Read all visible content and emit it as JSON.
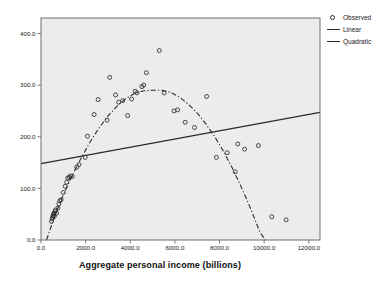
{
  "chart_data": {
    "type": "scatter",
    "title": "",
    "xlabel": "Aggregate personal income (billions)",
    "ylabel": "",
    "xlim": [
      0,
      12500
    ],
    "ylim": [
      0,
      430
    ],
    "xticks": [
      "0.0",
      "2000.0",
      "4000.0",
      "6000.0",
      "8000.0",
      "10000.0",
      "12000.0"
    ],
    "xtickvalues": [
      0,
      2000,
      4000,
      6000,
      8000,
      10000,
      12000
    ],
    "yticks": [
      "0.0",
      "100.0",
      "200.0",
      "300.0",
      "400.0"
    ],
    "ytickvalues": [
      0,
      100,
      200,
      300,
      400
    ],
    "grid": false,
    "legend_position": "right-outside",
    "plot_background": "#ececec",
    "frame_color": "#6e6e6e",
    "marker_color": "#2b2b2b",
    "line_color": "#2b2b2b",
    "series": [
      {
        "name": "Observed",
        "type": "scatter",
        "marker": "open-circle",
        "points": [
          [
            470,
            36
          ],
          [
            500,
            41
          ],
          [
            520,
            44
          ],
          [
            545,
            47
          ],
          [
            560,
            50
          ],
          [
            585,
            52
          ],
          [
            600,
            46
          ],
          [
            625,
            55
          ],
          [
            650,
            58
          ],
          [
            700,
            52
          ],
          [
            760,
            62
          ],
          [
            800,
            70
          ],
          [
            840,
            76
          ],
          [
            900,
            78
          ],
          [
            1000,
            92
          ],
          [
            1080,
            104
          ],
          [
            1150,
            112
          ],
          [
            1200,
            120
          ],
          [
            1260,
            122
          ],
          [
            1330,
            124
          ],
          [
            1400,
            123
          ],
          [
            1600,
            141
          ],
          [
            1700,
            146
          ],
          [
            1980,
            160
          ],
          [
            2080,
            201
          ],
          [
            2380,
            243
          ],
          [
            2560,
            272
          ],
          [
            2960,
            232
          ],
          [
            3080,
            315
          ],
          [
            3340,
            281
          ],
          [
            3480,
            267
          ],
          [
            3660,
            270
          ],
          [
            3880,
            241
          ],
          [
            4060,
            273
          ],
          [
            4220,
            288
          ],
          [
            4300,
            285
          ],
          [
            4520,
            297
          ],
          [
            4600,
            300
          ],
          [
            4720,
            324
          ],
          [
            5300,
            367
          ],
          [
            5520,
            285
          ],
          [
            5960,
            250
          ],
          [
            6120,
            252
          ],
          [
            6460,
            228
          ],
          [
            6880,
            218
          ],
          [
            7420,
            278
          ],
          [
            7860,
            160
          ],
          [
            8340,
            169
          ],
          [
            8700,
            132
          ],
          [
            8820,
            186
          ],
          [
            9120,
            176
          ],
          [
            9740,
            183
          ],
          [
            10340,
            45
          ],
          [
            10980,
            39
          ]
        ]
      },
      {
        "name": "Linear",
        "type": "line",
        "style": "solid",
        "endpoints": [
          [
            0,
            148
          ],
          [
            12500,
            247
          ]
        ]
      },
      {
        "name": "Quadratic",
        "type": "line",
        "style": "dash-dot",
        "vertex": [
          5400,
          290
        ],
        "curve_points": [
          [
            250,
            0
          ],
          [
            600,
            45
          ],
          [
            1000,
            87
          ],
          [
            1400,
            125
          ],
          [
            1800,
            159
          ],
          [
            2200,
            190
          ],
          [
            2600,
            217
          ],
          [
            3000,
            240
          ],
          [
            3400,
            259
          ],
          [
            3800,
            274
          ],
          [
            4200,
            284
          ],
          [
            4600,
            289
          ],
          [
            5000,
            290
          ],
          [
            5400,
            290
          ],
          [
            5800,
            286
          ],
          [
            6200,
            277
          ],
          [
            6600,
            263
          ],
          [
            7000,
            246
          ],
          [
            7400,
            224
          ],
          [
            7800,
            199
          ],
          [
            8200,
            170
          ],
          [
            8600,
            137
          ],
          [
            9000,
            100
          ],
          [
            9400,
            60
          ],
          [
            9800,
            16
          ],
          [
            10050,
            0
          ]
        ]
      }
    ]
  },
  "legend": {
    "items": [
      {
        "label": "Observed",
        "key": "open-circle"
      },
      {
        "label": "Linear",
        "key": "solid-line"
      },
      {
        "label": "Quadratic",
        "key": "solid-line"
      }
    ]
  },
  "axis": {
    "x_title": "Aggregate personal income (billions)"
  }
}
